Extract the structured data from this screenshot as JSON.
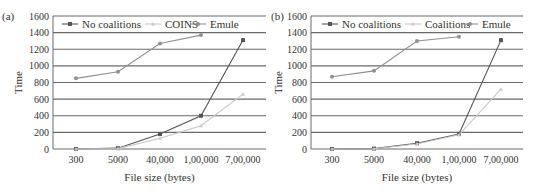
{
  "chart_data": [
    {
      "type": "line",
      "panel_label": "(a)",
      "title": "",
      "xlabel": "File size (bytes)",
      "ylabel": "Time",
      "ylim": [
        0,
        1600
      ],
      "yticks": [
        0,
        200,
        400,
        600,
        800,
        1000,
        1200,
        1400,
        1600
      ],
      "categories": [
        "300",
        "5000",
        "40,000",
        "1,00,000",
        "7,00,000"
      ],
      "grid": true,
      "legend_position": "top",
      "series": [
        {
          "name": "No coalitions",
          "color": "#555555",
          "marker": "square",
          "values": [
            0,
            10,
            180,
            400,
            1310
          ]
        },
        {
          "name": "COINS",
          "color": "#c8c8c8",
          "marker": "triangle",
          "values": [
            0,
            5,
            130,
            280,
            660
          ]
        },
        {
          "name": "Emule",
          "color": "#909090",
          "marker": "star",
          "values": [
            850,
            930,
            1270,
            1370,
            null
          ]
        }
      ]
    },
    {
      "type": "line",
      "panel_label": "(b)",
      "title": "",
      "xlabel": "File size (bytes)",
      "ylabel": "Time",
      "ylim": [
        0,
        1600
      ],
      "yticks": [
        0,
        200,
        400,
        600,
        800,
        1000,
        1200,
        1400,
        1600
      ],
      "categories": [
        "300",
        "5000",
        "40,000",
        "1,00,000",
        "7,00,000"
      ],
      "grid": true,
      "legend_position": "top",
      "series": [
        {
          "name": "No coalitions",
          "color": "#555555",
          "marker": "square",
          "values": [
            0,
            5,
            70,
            180,
            1310
          ]
        },
        {
          "name": "Coalitions",
          "color": "#c8c8c8",
          "marker": "triangle",
          "values": [
            0,
            3,
            60,
            170,
            720
          ]
        },
        {
          "name": "Emule",
          "color": "#909090",
          "marker": "star",
          "values": [
            870,
            940,
            1300,
            1350,
            null
          ]
        }
      ]
    }
  ]
}
